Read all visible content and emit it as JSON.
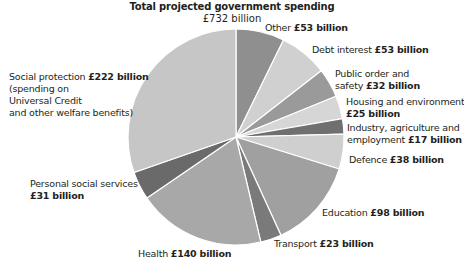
{
  "chart_data": {
    "type": "pie",
    "title": "Total projected government spending",
    "subtitle": "£732 billion",
    "total": 732,
    "unit": "£ billion",
    "start_angle_deg": 0,
    "direction": "clockwise",
    "slices": [
      {
        "name": "Other",
        "value": 53,
        "value_label": "£53 billion",
        "color": "#8f8f8f"
      },
      {
        "name": "Debt interest",
        "value": 53,
        "value_label": "£53 billion",
        "color": "#d0d0d0"
      },
      {
        "name": "Public order and safety",
        "value": 32,
        "value_label": "£32 billion",
        "color": "#9a9a9a"
      },
      {
        "name": "Housing and environment",
        "value": 25,
        "value_label": "£25 billion",
        "color": "#d6d6d6"
      },
      {
        "name": "Industry, agriculture and employment",
        "value": 17,
        "value_label": "£17 billion",
        "color": "#707070"
      },
      {
        "name": "Defence",
        "value": 38,
        "value_label": "£38 billion",
        "color": "#cfcfcf"
      },
      {
        "name": "Education",
        "value": 98,
        "value_label": "£98 billion",
        "color": "#a0a0a0"
      },
      {
        "name": "Transport",
        "value": 23,
        "value_label": "£23 billion",
        "color": "#7a7a7a"
      },
      {
        "name": "Health",
        "value": 140,
        "value_label": "£140 billion",
        "color": "#a8a8a8"
      },
      {
        "name": "Personal social services",
        "value": 31,
        "value_label": "£31 billion",
        "color": "#6a6a6a"
      },
      {
        "name": "Social protection",
        "value": 222,
        "value_label": "£222 billion",
        "note": "(spending on Universal Credit and other welfare benefits)",
        "color": "#c6c6c6"
      }
    ],
    "legend": "none (direct labels)"
  },
  "labels": {
    "other": {
      "text": "Other ",
      "value": "£53 billion"
    },
    "debt": {
      "text": "Debt interest ",
      "value": "£53 billion"
    },
    "public_order": {
      "line1": "Public order and",
      "line2": "safety ",
      "value": "£32 billion"
    },
    "housing": {
      "line1": "Housing and environment",
      "value": "£25 billion"
    },
    "industry": {
      "line1": "Industry, agriculture and",
      "line2": "employment ",
      "value": "£17 billion"
    },
    "defence": {
      "text": "Defence ",
      "value": "£38 billion"
    },
    "education": {
      "text": "Education ",
      "value": "£98 billion"
    },
    "transport": {
      "text": "Transport ",
      "value": "£23 billion"
    },
    "health": {
      "text": "Health ",
      "value": "£140 billion"
    },
    "personal": {
      "line1": "Personal social services",
      "value": "£31 billion"
    },
    "social": {
      "text": "Social protection ",
      "value": "£222 billion",
      "line2": "(spending on",
      "line3": "Universal Credit",
      "line4": "and other welfare benefits)"
    }
  },
  "geometry": {
    "cx": 236,
    "cy": 137,
    "r": 108,
    "separator_color": "#ffffff"
  }
}
